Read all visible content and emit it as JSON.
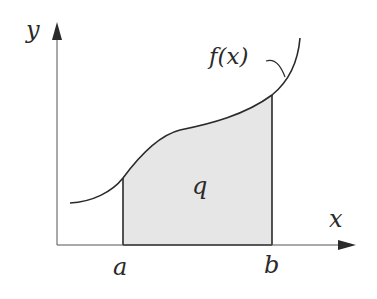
{
  "diagram": {
    "axes": {
      "x_label": "x",
      "y_label": "y"
    },
    "function_label": "f(x)",
    "area_label": "q",
    "bounds": {
      "lower": "a",
      "upper": "b"
    },
    "colors": {
      "stroke": "#2a2a2a",
      "axis": "#555555",
      "shade": "#e6e6e6"
    }
  }
}
